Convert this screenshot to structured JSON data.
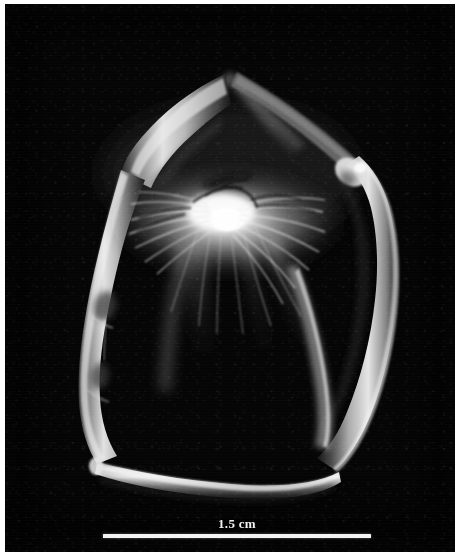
{
  "figure": {
    "kind": "scientific-specimen-micrograph",
    "background_color": "#050505",
    "page_color": "#ffffff",
    "specimen_highlight_color": "#f5f5f5",
    "specimen_midtone_color": "#8f8f8f",
    "specimen_shadow_color": "#1a1a1a"
  },
  "scale_bar": {
    "label": "1.5 cm",
    "value": 1.5,
    "unit": "cm",
    "bar_color": "#f4f4f4",
    "label_color": "#f2f2f2",
    "bar_length_px": 268,
    "position": "bottom-center"
  },
  "specimen_parts": [
    {
      "name": "apex-ridge",
      "description": "dim pointed ridge at top center"
    },
    {
      "name": "upper-left-limb",
      "description": "pale curved limb descending from apex to the left"
    },
    {
      "name": "upper-right-limb",
      "description": "pale curved limb descending from apex to the right"
    },
    {
      "name": "left-limb",
      "description": "long bright limb along the left side with a joint midway"
    },
    {
      "name": "right-limb",
      "description": "long bright limb along the right side with a joint near the top"
    },
    {
      "name": "bottom-limb",
      "description": "bright horizontal limb closing the ring at the bottom"
    },
    {
      "name": "central-setal-mass",
      "description": "bright fibrous feather-like mass at the center"
    }
  ]
}
